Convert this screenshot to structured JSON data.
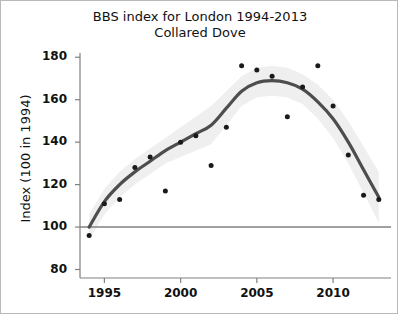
{
  "figure": {
    "title_line1": "BBS index for London 1994-2013",
    "title_line2": "Collared Dove",
    "background": "#ffffff",
    "frame_color": "#b9b9b9"
  },
  "chart_data": {
    "type": "scatter",
    "title": "BBS index for London 1994-2013 Collared Dove",
    "subtitle": "Collared Dove",
    "xlabel": "",
    "ylabel": "Index (100 in 1994)",
    "xlim": [
      1993.4,
      2013.8
    ],
    "ylim": [
      76,
      182
    ],
    "grid": false,
    "legend": "none",
    "xticks": [
      1995,
      2000,
      2005,
      2010
    ],
    "xtick_labels": [
      "1995",
      "2000",
      "2005",
      "2010"
    ],
    "yticks": [
      80,
      100,
      120,
      140,
      160,
      180
    ],
    "ytick_labels": [
      "80",
      "100",
      "120",
      "140",
      "160",
      "180"
    ],
    "reference_line": {
      "y": 100,
      "color": "#808080"
    },
    "point_color": "#1a1a1a",
    "line_color": "#4d4d4d",
    "band_color": "#ededed",
    "x": [
      1994,
      1995,
      1996,
      1997,
      1998,
      1999,
      2000,
      2001,
      2002,
      2003,
      2004,
      2005,
      2006,
      2007,
      2008,
      2009,
      2010,
      2011,
      2012,
      2013
    ],
    "series": [
      {
        "name": "Index points",
        "values": [
          96,
          111,
          113,
          128,
          133,
          117,
          140,
          143,
          129,
          147,
          176,
          174,
          171,
          152,
          166,
          176,
          157,
          134,
          115,
          113
        ]
      },
      {
        "name": "Smoothed trend",
        "values": [
          100,
          112,
          120,
          126,
          131,
          136,
          140,
          144,
          148,
          156,
          164,
          168,
          169,
          168,
          165,
          159,
          151,
          140,
          127,
          114
        ]
      },
      {
        "name": "Confidence band upper",
        "values": [
          106,
          118,
          126,
          132,
          137,
          142,
          147,
          152,
          157,
          164,
          171,
          175,
          176,
          175,
          172,
          167,
          160,
          150,
          138,
          126
        ]
      },
      {
        "name": "Confidence band lower",
        "values": [
          94,
          106,
          114,
          120,
          125,
          130,
          133,
          136,
          139,
          148,
          157,
          161,
          162,
          161,
          158,
          151,
          142,
          130,
          116,
          102
        ]
      }
    ]
  },
  "axis": {
    "y_title": "Index (100 in 1994)"
  }
}
